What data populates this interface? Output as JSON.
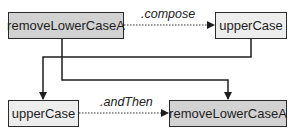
{
  "diagram": {
    "nodes": {
      "top_left": {
        "label": "removeLowerCaseA",
        "fill": "#d2d2d2"
      },
      "top_right": {
        "label": "upperCase",
        "fill": "#ededed"
      },
      "bottom_left": {
        "label": "upperCase",
        "fill": "#ededed"
      },
      "bottom_right": {
        "label": "removeLowerCaseA",
        "fill": "#d2d2d2"
      }
    },
    "edges": {
      "top": {
        "label": ".compose",
        "style": "dotted"
      },
      "bottom": {
        "label": ".andThen",
        "style": "dotted"
      }
    },
    "colors": {
      "line": "#2b2b2b"
    }
  }
}
